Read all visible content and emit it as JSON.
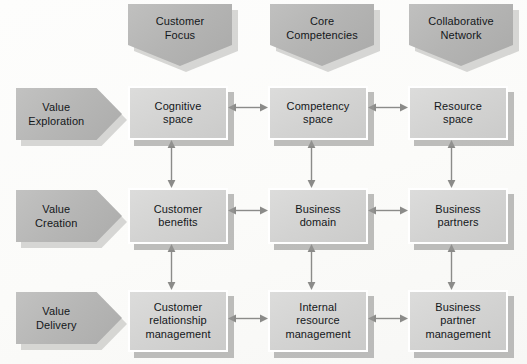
{
  "diagram": {
    "colors": {
      "background": "#fdfdfb",
      "header_fill": "#b4b4b3",
      "row_label_fill": "#b6b6b5",
      "box_fill": "#d3d3d2",
      "box_border": "#ffffff",
      "shadow": "#969694",
      "arrow": "#8b8b89",
      "text": "#14171a"
    },
    "column_headers": [
      {
        "id": "customer-focus",
        "label": "Customer\nFocus",
        "x": 128,
        "y": 4,
        "w": 104,
        "h": 62
      },
      {
        "id": "core-competencies",
        "label": "Core\nCompetencies",
        "x": 270,
        "y": 4,
        "w": 104,
        "h": 62
      },
      {
        "id": "collaborative-network",
        "label": "Collaborative\nNetwork",
        "x": 409,
        "y": 4,
        "w": 104,
        "h": 62
      }
    ],
    "row_labels": [
      {
        "id": "value-exploration",
        "label": "Value\nExploration",
        "x": 16,
        "y": 88,
        "w": 106,
        "h": 52
      },
      {
        "id": "value-creation",
        "label": "Value\nCreation",
        "x": 16,
        "y": 190,
        "w": 106,
        "h": 52
      },
      {
        "id": "value-delivery",
        "label": "Value\nDelivery",
        "x": 16,
        "y": 292,
        "w": 106,
        "h": 52
      }
    ],
    "cells": [
      {
        "id": "cognitive-space",
        "row": "value-exploration",
        "column": "customer-focus",
        "label": "Cognitive\nspace",
        "x": 128,
        "y": 86,
        "w": 100,
        "h": 54
      },
      {
        "id": "competency-space",
        "row": "value-exploration",
        "column": "core-competencies",
        "label": "Competency\nspace",
        "x": 268,
        "y": 86,
        "w": 100,
        "h": 54
      },
      {
        "id": "resource-space",
        "row": "value-exploration",
        "column": "collaborative-network",
        "label": "Resource\nspace",
        "x": 408,
        "y": 86,
        "w": 100,
        "h": 54
      },
      {
        "id": "customer-benefits",
        "row": "value-creation",
        "column": "customer-focus",
        "label": "Customer\nbenefits",
        "x": 128,
        "y": 188,
        "w": 100,
        "h": 56
      },
      {
        "id": "business-domain",
        "row": "value-creation",
        "column": "core-competencies",
        "label": "Business\ndomain",
        "x": 268,
        "y": 188,
        "w": 100,
        "h": 56
      },
      {
        "id": "business-partners",
        "row": "value-creation",
        "column": "collaborative-network",
        "label": "Business\npartners",
        "x": 408,
        "y": 188,
        "w": 100,
        "h": 56
      },
      {
        "id": "customer-relationship-management",
        "row": "value-delivery",
        "column": "customer-focus",
        "label": "Customer\nrelationship\nmanagement",
        "x": 128,
        "y": 290,
        "w": 100,
        "h": 62
      },
      {
        "id": "internal-resource-management",
        "row": "value-delivery",
        "column": "core-competencies",
        "label": "Internal\nresource\nmanagement",
        "x": 268,
        "y": 290,
        "w": 100,
        "h": 62
      },
      {
        "id": "business-partner-management",
        "row": "value-delivery",
        "column": "collaborative-network",
        "label": "Business\npartner\nmanagement",
        "x": 408,
        "y": 290,
        "w": 100,
        "h": 62
      }
    ],
    "connectors_horizontal": [
      {
        "id": "cognitive-space--competency-space",
        "from": "cognitive-space",
        "to": "competency-space",
        "style": "double-headed",
        "x": 228,
        "y": 107,
        "w": 40
      },
      {
        "id": "competency-space--resource-space",
        "from": "competency-space",
        "to": "resource-space",
        "style": "double-headed",
        "x": 368,
        "y": 107,
        "w": 40
      },
      {
        "id": "customer-benefits--business-domain",
        "from": "customer-benefits",
        "to": "business-domain",
        "style": "double-headed",
        "x": 228,
        "y": 210,
        "w": 40
      },
      {
        "id": "business-domain--business-partners",
        "from": "business-domain",
        "to": "business-partners",
        "style": "double-headed",
        "x": 368,
        "y": 210,
        "w": 40
      },
      {
        "id": "customer-relationship-management--internal-resource-management",
        "from": "customer-relationship-management",
        "to": "internal-resource-management",
        "style": "double-headed",
        "x": 228,
        "y": 318,
        "w": 40
      },
      {
        "id": "internal-resource-management--business-partner-management",
        "from": "internal-resource-management",
        "to": "business-partner-management",
        "style": "double-headed",
        "x": 368,
        "y": 318,
        "w": 40
      }
    ],
    "connectors_vertical": [
      {
        "id": "cognitive-space--customer-benefits",
        "from": "cognitive-space",
        "to": "customer-benefits",
        "style": "double-headed",
        "x": 171,
        "y": 140,
        "h": 48
      },
      {
        "id": "competency-space--business-domain",
        "from": "competency-space",
        "to": "business-domain",
        "style": "double-headed",
        "x": 311,
        "y": 140,
        "h": 48
      },
      {
        "id": "resource-space--business-partners",
        "from": "resource-space",
        "to": "business-partners",
        "style": "double-headed",
        "x": 451,
        "y": 140,
        "h": 48
      },
      {
        "id": "customer-benefits--customer-relationship-management",
        "from": "customer-benefits",
        "to": "customer-relationship-management",
        "style": "double-headed",
        "x": 171,
        "y": 244,
        "h": 46
      },
      {
        "id": "business-domain--internal-resource-management",
        "from": "business-domain",
        "to": "internal-resource-management",
        "style": "double-headed",
        "x": 311,
        "y": 244,
        "h": 46
      },
      {
        "id": "business-partners--business-partner-management",
        "from": "business-partners",
        "to": "business-partner-management",
        "style": "double-headed",
        "x": 451,
        "y": 244,
        "h": 46
      }
    ]
  }
}
